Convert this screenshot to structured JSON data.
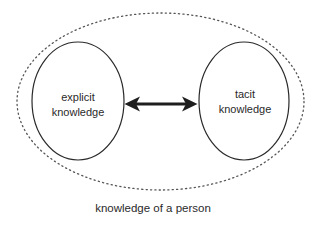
{
  "diagram": {
    "type": "concept-diagram",
    "container": {
      "label": "knowledge of a person",
      "shape": "dotted-ellipse"
    },
    "nodes": [
      {
        "id": "explicit",
        "label_line1": "explicit",
        "label_line2": "knowledge",
        "shape": "ellipse"
      },
      {
        "id": "tacit",
        "label_line1": "tacit",
        "label_line2": "knowledge",
        "shape": "ellipse"
      }
    ],
    "edges": [
      {
        "from": "explicit",
        "to": "tacit",
        "type": "bidirectional-arrow"
      }
    ],
    "colors": {
      "stroke": "#2a2a2a",
      "arrow": "#1e1e1e",
      "dots": "#555555",
      "background": "#ffffff",
      "text": "#2a2a2a"
    }
  }
}
